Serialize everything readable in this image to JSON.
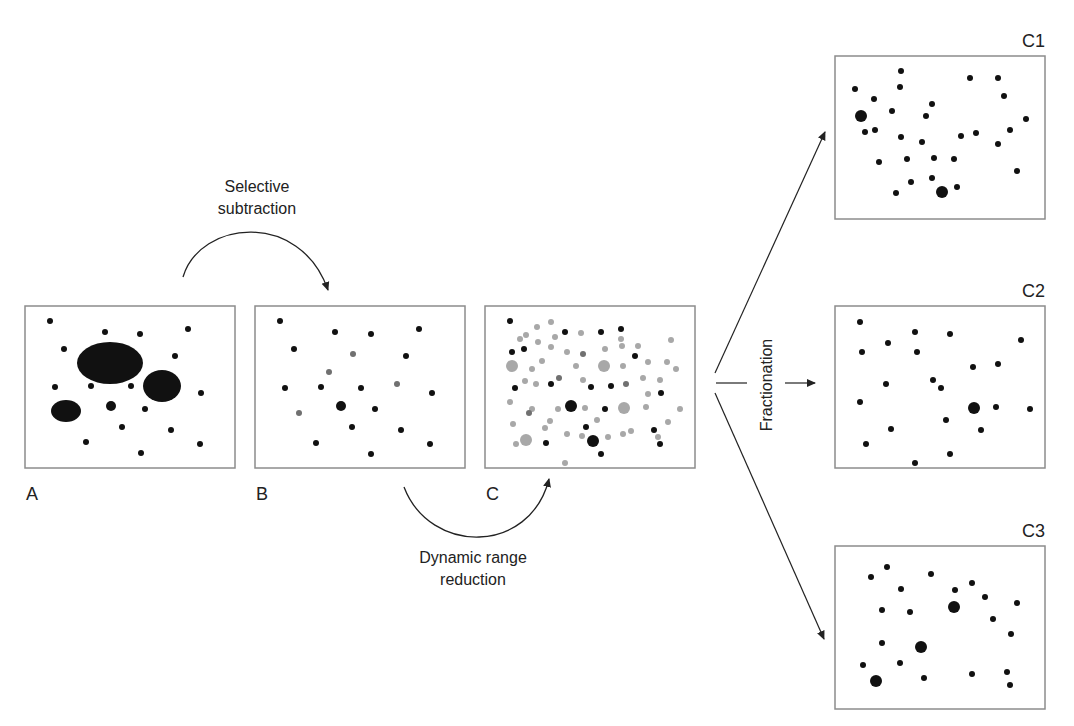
{
  "labels": {
    "selective_subtraction_1": "Selective",
    "selective_subtraction_2": "subtraction",
    "dynamic_range_1": "Dynamic range",
    "dynamic_range_2": "reduction",
    "fractionation": "Fractionation",
    "panel_a": "A",
    "panel_b": "B",
    "panel_c": "C",
    "panel_c1": "C1",
    "panel_c2": "C2",
    "panel_c3": "C3"
  },
  "colors": {
    "dot_black": "#111111",
    "dot_gray": "#a8a8a8",
    "dot_midgray": "#707070",
    "frame": "#8c8c8c",
    "arrow": "#222222"
  },
  "panels": {
    "A": {
      "x": 25,
      "y": 306,
      "w": 210,
      "h": 162,
      "ellipses": [
        [
          110,
          363,
          33,
          21
        ],
        [
          162,
          386,
          19,
          16
        ],
        [
          66,
          411,
          15,
          11
        ]
      ],
      "dots": [
        [
          50,
          321,
          3,
          "k"
        ],
        [
          105,
          332,
          3,
          "k"
        ],
        [
          140,
          334,
          3,
          "k"
        ],
        [
          188,
          329,
          3,
          "k"
        ],
        [
          64,
          349,
          3,
          "k"
        ],
        [
          175,
          356,
          3,
          "k"
        ],
        [
          55,
          387,
          3,
          "k"
        ],
        [
          91,
          386,
          3,
          "k"
        ],
        [
          131,
          386,
          3,
          "k"
        ],
        [
          201,
          393,
          3,
          "k"
        ],
        [
          111,
          406,
          5,
          "k"
        ],
        [
          145,
          409,
          3,
          "k"
        ],
        [
          122,
          427,
          3,
          "k"
        ],
        [
          171,
          430,
          3,
          "k"
        ],
        [
          86,
          442,
          3,
          "k"
        ],
        [
          200,
          444,
          3,
          "k"
        ],
        [
          141,
          453,
          3,
          "k"
        ]
      ]
    },
    "B": {
      "x": 255,
      "y": 306,
      "w": 210,
      "h": 162,
      "dots": [
        [
          280,
          321,
          3,
          "k"
        ],
        [
          335,
          332,
          3,
          "k"
        ],
        [
          371,
          334,
          3,
          "k"
        ],
        [
          419,
          329,
          3,
          "k"
        ],
        [
          294,
          349,
          3,
          "k"
        ],
        [
          353,
          354,
          3,
          "m"
        ],
        [
          406,
          356,
          3,
          "k"
        ],
        [
          329,
          372,
          3,
          "m"
        ],
        [
          285,
          388,
          3,
          "k"
        ],
        [
          321,
          387,
          3,
          "k"
        ],
        [
          361,
          388,
          3,
          "k"
        ],
        [
          397,
          384,
          3,
          "m"
        ],
        [
          432,
          393,
          3,
          "k"
        ],
        [
          299,
          413,
          3,
          "m"
        ],
        [
          341,
          406,
          5,
          "k"
        ],
        [
          375,
          409,
          3,
          "k"
        ],
        [
          352,
          427,
          3,
          "k"
        ],
        [
          401,
          430,
          3,
          "k"
        ],
        [
          316,
          443,
          3,
          "k"
        ],
        [
          430,
          444,
          3,
          "k"
        ],
        [
          371,
          454,
          3,
          "k"
        ]
      ]
    },
    "C": {
      "x": 485,
      "y": 306,
      "w": 210,
      "h": 162,
      "dots": [
        [
          510,
          321,
          3,
          "k"
        ],
        [
          537,
          327,
          3,
          "g"
        ],
        [
          551,
          322,
          3,
          "g"
        ],
        [
          520,
          339,
          3,
          "g"
        ],
        [
          526,
          335,
          3,
          "g"
        ],
        [
          555,
          337,
          3,
          "g"
        ],
        [
          565,
          332,
          3,
          "k"
        ],
        [
          581,
          333,
          3,
          "g"
        ],
        [
          601,
          332,
          3,
          "k"
        ],
        [
          621,
          329,
          3,
          "k"
        ],
        [
          621,
          339,
          3,
          "g"
        ],
        [
          638,
          346,
          3,
          "g"
        ],
        [
          671,
          340,
          3,
          "g"
        ],
        [
          538,
          342,
          3,
          "g"
        ],
        [
          551,
          347,
          3,
          "g"
        ],
        [
          512,
          352,
          3,
          "k"
        ],
        [
          524,
          349,
          3,
          "k"
        ],
        [
          567,
          352,
          3,
          "g"
        ],
        [
          583,
          354,
          3,
          "m"
        ],
        [
          605,
          349,
          3,
          "g"
        ],
        [
          622,
          346,
          3,
          "g"
        ],
        [
          635,
          356,
          3,
          "k"
        ],
        [
          512,
          366,
          6,
          "g"
        ],
        [
          542,
          361,
          3,
          "g"
        ],
        [
          532,
          369,
          3,
          "g"
        ],
        [
          576,
          366,
          3,
          "g"
        ],
        [
          604,
          366,
          6,
          "g"
        ],
        [
          623,
          366,
          3,
          "g"
        ],
        [
          648,
          362,
          3,
          "g"
        ],
        [
          667,
          362,
          3,
          "g"
        ],
        [
          676,
          369,
          3,
          "g"
        ],
        [
          559,
          378,
          3,
          "m"
        ],
        [
          525,
          381,
          3,
          "g"
        ],
        [
          536,
          384,
          3,
          "g"
        ],
        [
          551,
          384,
          3,
          "k"
        ],
        [
          583,
          380,
          3,
          "g"
        ],
        [
          515,
          388,
          3,
          "k"
        ],
        [
          591,
          387,
          3,
          "k"
        ],
        [
          611,
          386,
          3,
          "k"
        ],
        [
          626,
          384,
          3,
          "m"
        ],
        [
          643,
          378,
          3,
          "g"
        ],
        [
          660,
          380,
          3,
          "g"
        ],
        [
          510,
          402,
          3,
          "g"
        ],
        [
          532,
          409,
          3,
          "g"
        ],
        [
          648,
          394,
          3,
          "g"
        ],
        [
          661,
          393,
          3,
          "k"
        ],
        [
          558,
          409,
          3,
          "g"
        ],
        [
          571,
          406,
          6,
          "k"
        ],
        [
          585,
          408,
          3,
          "g"
        ],
        [
          605,
          409,
          3,
          "k"
        ],
        [
          624,
          408,
          6,
          "g"
        ],
        [
          646,
          407,
          3,
          "g"
        ],
        [
          680,
          409,
          3,
          "g"
        ],
        [
          529,
          413,
          3,
          "m"
        ],
        [
          513,
          424,
          3,
          "g"
        ],
        [
          545,
          428,
          3,
          "g"
        ],
        [
          550,
          421,
          3,
          "g"
        ],
        [
          597,
          420,
          3,
          "g"
        ],
        [
          567,
          434,
          3,
          "g"
        ],
        [
          582,
          436,
          3,
          "g"
        ],
        [
          586,
          427,
          3,
          "k"
        ],
        [
          631,
          431,
          3,
          "g"
        ],
        [
          654,
          430,
          3,
          "k"
        ],
        [
          668,
          422,
          3,
          "g"
        ],
        [
          658,
          437,
          3,
          "g"
        ],
        [
          516,
          444,
          3,
          "g"
        ],
        [
          526,
          440,
          6,
          "g"
        ],
        [
          546,
          443,
          3,
          "k"
        ],
        [
          593,
          441,
          6,
          "k"
        ],
        [
          608,
          437,
          3,
          "g"
        ],
        [
          623,
          434,
          3,
          "g"
        ],
        [
          601,
          454,
          3,
          "k"
        ],
        [
          565,
          463,
          3,
          "g"
        ],
        [
          660,
          444,
          3,
          "k"
        ]
      ]
    },
    "C1": {
      "x": 835,
      "y": 56,
      "w": 210,
      "h": 163,
      "dots": [
        [
          901,
          71,
          3,
          "k"
        ],
        [
          970,
          78,
          3,
          "k"
        ],
        [
          998,
          78,
          3,
          "k"
        ],
        [
          855,
          89,
          3,
          "k"
        ],
        [
          900,
          87,
          3,
          "k"
        ],
        [
          874,
          99,
          3,
          "k"
        ],
        [
          932,
          104,
          3,
          "k"
        ],
        [
          1004,
          96,
          3,
          "k"
        ],
        [
          892,
          111,
          3,
          "k"
        ],
        [
          861,
          116,
          6,
          "k"
        ],
        [
          926,
          116,
          3,
          "k"
        ],
        [
          1026,
          119,
          3,
          "k"
        ],
        [
          865,
          132,
          3,
          "k"
        ],
        [
          875,
          130,
          3,
          "k"
        ],
        [
          901,
          137,
          3,
          "k"
        ],
        [
          922,
          142,
          3,
          "k"
        ],
        [
          961,
          136,
          3,
          "k"
        ],
        [
          976,
          133,
          3,
          "k"
        ],
        [
          1010,
          130,
          3,
          "k"
        ],
        [
          998,
          144,
          3,
          "k"
        ],
        [
          879,
          162,
          3,
          "k"
        ],
        [
          907,
          159,
          3,
          "k"
        ],
        [
          934,
          158,
          3,
          "k"
        ],
        [
          954,
          159,
          3,
          "k"
        ],
        [
          1017,
          171,
          3,
          "k"
        ],
        [
          932,
          178,
          3,
          "k"
        ],
        [
          911,
          182,
          3,
          "k"
        ],
        [
          942,
          192,
          6,
          "k"
        ],
        [
          957,
          187,
          3,
          "k"
        ],
        [
          896,
          193,
          3,
          "k"
        ]
      ]
    },
    "C2": {
      "x": 835,
      "y": 306,
      "w": 210,
      "h": 162,
      "dots": [
        [
          860,
          322,
          3,
          "k"
        ],
        [
          915,
          332,
          3,
          "k"
        ],
        [
          950,
          334,
          3,
          "k"
        ],
        [
          888,
          343,
          3,
          "k"
        ],
        [
          1021,
          340,
          3,
          "k"
        ],
        [
          862,
          352,
          3,
          "k"
        ],
        [
          917,
          352,
          3,
          "k"
        ],
        [
          973,
          367,
          3,
          "k"
        ],
        [
          998,
          364,
          3,
          "k"
        ],
        [
          886,
          384,
          3,
          "k"
        ],
        [
          933,
          380,
          3,
          "k"
        ],
        [
          941,
          388,
          3,
          "k"
        ],
        [
          860,
          402,
          3,
          "k"
        ],
        [
          974,
          408,
          6,
          "k"
        ],
        [
          996,
          407,
          3,
          "k"
        ],
        [
          1030,
          409,
          3,
          "k"
        ],
        [
          946,
          420,
          3,
          "k"
        ],
        [
          891,
          429,
          3,
          "k"
        ],
        [
          981,
          430,
          3,
          "k"
        ],
        [
          866,
          444,
          3,
          "k"
        ],
        [
          950,
          454,
          3,
          "k"
        ],
        [
          915,
          463,
          3,
          "k"
        ]
      ]
    },
    "C3": {
      "x": 835,
      "y": 546,
      "w": 210,
      "h": 163,
      "dots": [
        [
          887,
          567,
          3,
          "k"
        ],
        [
          871,
          577,
          3,
          "k"
        ],
        [
          931,
          574,
          3,
          "k"
        ],
        [
          972,
          583,
          3,
          "k"
        ],
        [
          901,
          589,
          3,
          "k"
        ],
        [
          955,
          590,
          3,
          "k"
        ],
        [
          985,
          597,
          3,
          "k"
        ],
        [
          1017,
          603,
          3,
          "k"
        ],
        [
          882,
          610,
          3,
          "k"
        ],
        [
          910,
          612,
          3,
          "k"
        ],
        [
          954,
          607,
          6,
          "k"
        ],
        [
          993,
          619,
          3,
          "k"
        ],
        [
          1011,
          634,
          3,
          "k"
        ],
        [
          882,
          643,
          3,
          "k"
        ],
        [
          921,
          647,
          6,
          "k"
        ],
        [
          863,
          665,
          3,
          "k"
        ],
        [
          900,
          663,
          3,
          "k"
        ],
        [
          876,
          681,
          6,
          "k"
        ],
        [
          924,
          678,
          3,
          "k"
        ],
        [
          972,
          674,
          3,
          "k"
        ],
        [
          1007,
          672,
          3,
          "k"
        ],
        [
          1010,
          685,
          3,
          "k"
        ]
      ]
    }
  }
}
